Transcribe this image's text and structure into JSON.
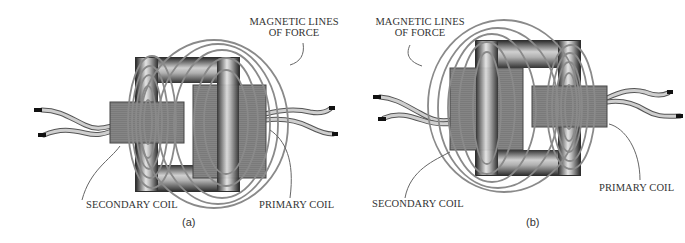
{
  "figures": [
    {
      "id": "a",
      "caption": "(a)",
      "labels": {
        "magnetic_lines_line1": "MAGNETIC LINES",
        "magnetic_lines_line2": "OF FORCE",
        "secondary_coil": "SECONDARY COIL",
        "primary_coil": "PRIMARY COIL"
      }
    },
    {
      "id": "b",
      "caption": "(b)",
      "labels": {
        "magnetic_lines_line1": "MAGNETIC LINES",
        "magnetic_lines_line2": "OF FORCE",
        "secondary_coil": "SECONDARY COIL",
        "primary_coil": "PRIMARY COIL"
      }
    }
  ],
  "colors": {
    "core_dark": "#3a3a3a",
    "core_light": "#d8d8d8",
    "coil_block": "#7a7a7a",
    "field_lines": "#8a8a8a",
    "wire": "#c8c8c8",
    "text": "#333333"
  }
}
